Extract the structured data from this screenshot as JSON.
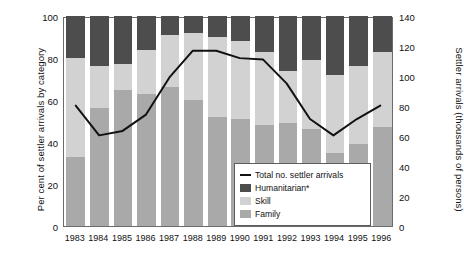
{
  "chart_data": {
    "type": "bar",
    "subtype": "stacked-bar-with-line",
    "title": "",
    "xlabel": "",
    "ylabel": "Per cent of settler arrivals by category",
    "ylabel_secondary": "Settler arrivals (thousands of persons)",
    "categories": [
      "1983",
      "1984",
      "1985",
      "1986",
      "1987",
      "1988",
      "1989",
      "1990",
      "1991",
      "1992",
      "1993",
      "1994",
      "1995",
      "1996"
    ],
    "ylim": [
      0,
      100
    ],
    "yticks": [
      0,
      20,
      40,
      60,
      80,
      100
    ],
    "ylim_secondary": [
      0,
      140
    ],
    "yticks_secondary": [
      0,
      20,
      40,
      60,
      80,
      100,
      120,
      140
    ],
    "grid": false,
    "legend_position": "inside-lower-right",
    "series": [
      {
        "name": "Family",
        "type": "bar",
        "color": "#a9a9a9",
        "axis": "left",
        "values": [
          33,
          56,
          65,
          63,
          66,
          60,
          52,
          51,
          48,
          49,
          46,
          35,
          39,
          47
        ]
      },
      {
        "name": "Skill",
        "type": "bar",
        "color": "#d2d2d2",
        "axis": "left",
        "values": [
          47,
          20,
          12,
          21,
          25,
          32,
          38,
          37,
          35,
          25,
          33,
          37,
          37,
          36
        ]
      },
      {
        "name": "Humanitarian*",
        "type": "bar",
        "color": "#4d4d4d",
        "axis": "left",
        "values": [
          20,
          24,
          23,
          16,
          9,
          8,
          10,
          12,
          17,
          26,
          21,
          28,
          24,
          17
        ]
      },
      {
        "name": "Total no. settler arrivals",
        "type": "line",
        "color": "#111111",
        "axis": "right",
        "values": [
          81,
          61,
          64,
          75,
          100,
          118,
          118,
          113,
          112,
          96,
          72,
          61,
          72,
          81
        ]
      }
    ]
  },
  "axes": {
    "left_title": "Per cent of settler arrivals by category",
    "right_title": "Settler arrivals (thousands of persons)",
    "left_ticks": [
      "100",
      "80",
      "60",
      "40",
      "20",
      "0"
    ],
    "right_ticks": [
      "140",
      "120",
      "100",
      "80",
      "60",
      "40",
      "20",
      "0"
    ],
    "x_ticks": [
      "1983",
      "1984",
      "1985",
      "1986",
      "1987",
      "1988",
      "1989",
      "1990",
      "1991",
      "1992",
      "1993",
      "1994",
      "1995",
      "1996"
    ]
  },
  "legend": {
    "items": [
      {
        "label": "Total no. settler arrivals",
        "marker": "line",
        "color": "#111111"
      },
      {
        "label": "Humanitarian*",
        "marker": "swatch",
        "color": "#4d4d4d"
      },
      {
        "label": "Skill",
        "marker": "swatch",
        "color": "#d2d2d2"
      },
      {
        "label": "Family",
        "marker": "swatch",
        "color": "#a9a9a9"
      }
    ]
  },
  "colors": {
    "family": "#a9a9a9",
    "skill": "#d2d2d2",
    "humanitarian": "#4d4d4d",
    "line": "#111111",
    "frame": "#6b6b6b",
    "background": "#ffffff"
  }
}
